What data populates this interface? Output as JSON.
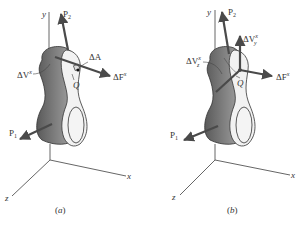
{
  "figures": [
    {
      "id": "a",
      "caption": "(a)",
      "labels": {
        "y_axis": "y",
        "x_axis": "x",
        "z_axis": "z",
        "p2": "P",
        "p2_sub": "2",
        "p1": "P",
        "p1_sub": "1",
        "delta_a": "ΔA",
        "delta_v": "ΔV",
        "delta_v_sup": "x",
        "delta_f": "ΔF",
        "delta_f_sup": "x",
        "point": "Q"
      }
    },
    {
      "id": "b",
      "caption": "(b)",
      "labels": {
        "y_axis": "y",
        "x_axis": "x",
        "z_axis": "z",
        "p2": "P",
        "p2_sub": "2",
        "p1": "P",
        "p1_sub": "1",
        "delta_vy": "ΔV",
        "delta_vy_sub": "y",
        "delta_vy_sup": "x",
        "delta_vz": "ΔV",
        "delta_vz_sub": "z",
        "delta_vz_sup": "x",
        "delta_f": "ΔF",
        "delta_f_sup": "x",
        "point": "Q"
      }
    }
  ]
}
